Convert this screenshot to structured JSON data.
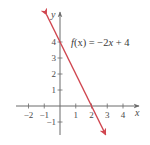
{
  "chart_data": {
    "type": "line",
    "title": "",
    "xlabel": "x",
    "ylabel": "y",
    "xlim": [
      -2.8,
      5
    ],
    "ylim": [
      -1.8,
      5.9
    ],
    "grid": false,
    "x_ticks": [
      -2,
      -1,
      1,
      2,
      3,
      4
    ],
    "y_ticks": [
      -1,
      1,
      2,
      3,
      4
    ],
    "x_tick_labels": [
      "−2",
      "−1",
      "1",
      "2",
      "3",
      "4"
    ],
    "y_tick_labels": [
      "−1",
      "1",
      "2",
      "3",
      "4"
    ],
    "series": [
      {
        "name": "f(x) = −2x + 4",
        "equation": "f(x) = -2x + 4",
        "slope": -2,
        "intercept": 4,
        "x": [
          -0.85,
          2.9
        ],
        "values": [
          5.7,
          -1.8
        ],
        "color": "#d0454f",
        "arrows": "both"
      }
    ],
    "annotations": [
      {
        "text_prefix": "f",
        "text_mid": "(x) = −2",
        "text_var": "x",
        "text_suffix": " + 4",
        "x": 0.7,
        "y": 4
      }
    ]
  },
  "colors": {
    "axis": "#6a6a6a",
    "line": "#d0454f",
    "text": "#4a4a4a"
  }
}
